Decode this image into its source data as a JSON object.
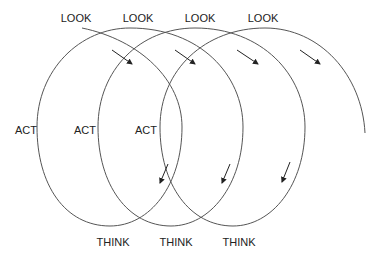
{
  "diagram": {
    "type": "spiral-cycle",
    "stroke_color": "#555555",
    "arrow_color": "#222222",
    "labels": {
      "look": [
        {
          "text": "LOOK",
          "x": 76,
          "y": 13
        },
        {
          "text": "LOOK",
          "x": 138,
          "y": 13
        },
        {
          "text": "LOOK",
          "x": 200,
          "y": 13
        },
        {
          "text": "LOOK",
          "x": 263,
          "y": 13
        }
      ],
      "act": [
        {
          "text": "ACT",
          "x": 26,
          "y": 125
        },
        {
          "text": "ACT",
          "x": 85,
          "y": 125
        },
        {
          "text": "ACT",
          "x": 146,
          "y": 125
        }
      ],
      "think": [
        {
          "text": "THINK",
          "x": 113,
          "y": 237
        },
        {
          "text": "THINK",
          "x": 176,
          "y": 237
        },
        {
          "text": "THINK",
          "x": 239,
          "y": 237
        }
      ]
    }
  }
}
